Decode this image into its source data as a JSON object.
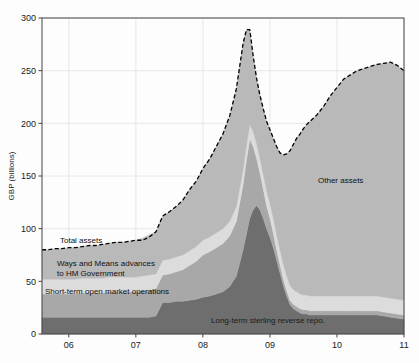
{
  "figure": {
    "title": "",
    "ylabel": "GBP (billions)",
    "xlabel": ""
  },
  "axis": {
    "y_ticks": [
      "0",
      "50",
      "100",
      "150",
      "200",
      "250",
      "300"
    ],
    "x_ticks": [
      "06",
      "07",
      "08",
      "09",
      "10",
      "11"
    ]
  },
  "annotations": {
    "total_assets": "Total assets",
    "ways_means_line1": "Ways and Means advances",
    "ways_means_line2": "to HM Government",
    "short_term": "Short-term open market operations",
    "other_assets": "Other assets",
    "long_term_repo": "Long-term sterling reverse repo."
  },
  "colors": {
    "long_term_repo": "#6e6e6e",
    "short_term_omo": "#a8a8a8",
    "ways_means": "#dcdcdc",
    "other_assets": "#b9b9b9",
    "total_assets_line": "#000000",
    "grid": "#e2e2e2",
    "axis": "#444444",
    "background": "#fdfdfd"
  },
  "chart_data": {
    "type": "area",
    "title": "",
    "xlabel": "",
    "ylabel": "GBP (billions)",
    "xlim": [
      2005.6,
      2011.0
    ],
    "ylim": [
      0,
      300
    ],
    "grid": true,
    "stacked": true,
    "legend": "inline-annotations",
    "x": [
      2005.6,
      2005.7,
      2005.8,
      2005.9,
      2006.0,
      2006.1,
      2006.2,
      2006.3,
      2006.4,
      2006.5,
      2006.6,
      2006.7,
      2006.8,
      2006.9,
      2007.0,
      2007.1,
      2007.2,
      2007.3,
      2007.4,
      2007.5,
      2007.6,
      2007.7,
      2007.8,
      2007.9,
      2008.0,
      2008.1,
      2008.2,
      2008.3,
      2008.4,
      2008.5,
      2008.6,
      2008.65,
      2008.7,
      2008.75,
      2008.8,
      2008.85,
      2008.9,
      2008.95,
      2009.0,
      2009.05,
      2009.1,
      2009.15,
      2009.2,
      2009.25,
      2009.3,
      2009.35,
      2009.4,
      2009.45,
      2009.5,
      2009.55,
      2009.6,
      2009.7,
      2009.8,
      2009.9,
      2010.0,
      2010.1,
      2010.2,
      2010.3,
      2010.4,
      2010.5,
      2010.6,
      2010.7,
      2010.8,
      2010.9,
      2011.0
    ],
    "series": [
      {
        "name": "Long-term sterling reverse repo.",
        "color": "#6e6e6e",
        "values": [
          16,
          16,
          16,
          16,
          16,
          16,
          16,
          16,
          16,
          16,
          16,
          16,
          16,
          16,
          16,
          16,
          16,
          17,
          30,
          30,
          31,
          31,
          32,
          33,
          35,
          36,
          38,
          40,
          45,
          55,
          80,
          95,
          110,
          118,
          122,
          118,
          110,
          100,
          92,
          82,
          70,
          58,
          46,
          36,
          28,
          24,
          22,
          20,
          19,
          19,
          18,
          18,
          18,
          18,
          18,
          18,
          18,
          18,
          18,
          18,
          18,
          17,
          16,
          15,
          14
        ]
      },
      {
        "name": "Short-term open market operations",
        "color": "#a8a8a8",
        "values": [
          22,
          22,
          22,
          22,
          22,
          22,
          23,
          23,
          23,
          23,
          24,
          24,
          24,
          24,
          24,
          25,
          26,
          26,
          26,
          27,
          28,
          30,
          33,
          36,
          40,
          42,
          44,
          46,
          48,
          52,
          62,
          70,
          75,
          60,
          45,
          35,
          28,
          22,
          18,
          14,
          10,
          8,
          6,
          5,
          4,
          4,
          4,
          4,
          4,
          4,
          4,
          4,
          4,
          4,
          4,
          4,
          4,
          4,
          4,
          4,
          4,
          4,
          4,
          4,
          4
        ]
      },
      {
        "name": "Ways and Means advances to HM Government",
        "color": "#dcdcdc",
        "values": [
          14,
          14,
          14,
          14,
          14,
          14,
          14,
          14,
          14,
          14,
          14,
          14,
          14,
          14,
          14,
          14,
          14,
          14,
          14,
          14,
          14,
          14,
          14,
          14,
          14,
          14,
          14,
          14,
          14,
          14,
          14,
          14,
          14,
          14,
          14,
          14,
          14,
          14,
          14,
          14,
          14,
          14,
          14,
          14,
          14,
          14,
          14,
          14,
          14,
          14,
          14,
          14,
          14,
          14,
          14,
          14,
          14,
          14,
          14,
          14,
          14,
          14,
          14,
          14,
          14
        ]
      },
      {
        "name": "Other assets",
        "color": "#b9b9b9",
        "values": [
          28,
          28,
          29,
          29,
          30,
          30,
          30,
          31,
          31,
          32,
          32,
          33,
          33,
          34,
          35,
          36,
          38,
          40,
          42,
          45,
          48,
          52,
          58,
          62,
          68,
          74,
          82,
          90,
          100,
          112,
          120,
          110,
          90,
          72,
          62,
          60,
          62,
          66,
          70,
          76,
          84,
          92,
          104,
          116,
          128,
          138,
          146,
          152,
          158,
          162,
          166,
          172,
          180,
          190,
          198,
          206,
          210,
          214,
          216,
          218,
          220,
          222,
          224,
          222,
          218
        ]
      }
    ],
    "total_line": {
      "name": "Total assets",
      "color": "#000000",
      "style": "dashed",
      "values": [
        80,
        80,
        81,
        81,
        82,
        82,
        83,
        84,
        84,
        85,
        86,
        87,
        87,
        88,
        89,
        89,
        92,
        97,
        112,
        116,
        121,
        127,
        137,
        145,
        157,
        166,
        178,
        190,
        207,
        233,
        276,
        289,
        289,
        264,
        243,
        227,
        214,
        202,
        194,
        186,
        178,
        172,
        170,
        171,
        174,
        180,
        186,
        190,
        195,
        199,
        202,
        208,
        216,
        226,
        234,
        242,
        246,
        250,
        252,
        254,
        256,
        257,
        258,
        255,
        250
      ]
    }
  }
}
